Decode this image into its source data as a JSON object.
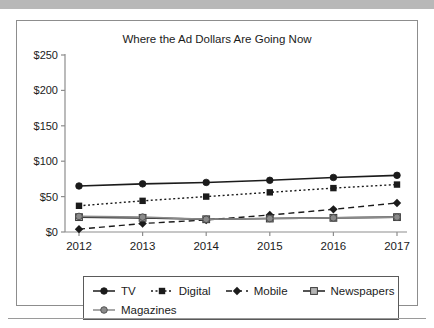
{
  "figure": {
    "title": "Where the Ad Dollars Are Going Now"
  },
  "legend": {
    "items": [
      {
        "label": "TV",
        "marker": "circle-filled",
        "dash": "solid",
        "color": "#1b1b1b"
      },
      {
        "label": "Digital",
        "marker": "square-filled",
        "dash": "dotted",
        "color": "#1b1b1b"
      },
      {
        "label": "Mobile",
        "marker": "diamond-filled",
        "dash": "dashed",
        "color": "#1b1b1b"
      },
      {
        "label": "Newspapers",
        "marker": "square-open",
        "dash": "solid",
        "color": "#1b1b1b"
      },
      {
        "label": "Magazines",
        "marker": "circle-filled-gray",
        "dash": "solid",
        "color": "#8a8a8a"
      }
    ]
  },
  "chart_data": {
    "type": "line",
    "title": "Where the Ad Dollars Are Going Now",
    "xlabel": "",
    "ylabel": "",
    "x": [
      "2012",
      "2013",
      "2014",
      "2015",
      "2016",
      "2017"
    ],
    "categories": [
      "2012",
      "2013",
      "2014",
      "2015",
      "2016",
      "2017"
    ],
    "ytick_labels": [
      "$0",
      "$50",
      "$100",
      "$150",
      "$200",
      "$250"
    ],
    "ytick_values": [
      0,
      50,
      100,
      150,
      200,
      250
    ],
    "ylim": [
      0,
      250
    ],
    "grid": false,
    "legend_position": "bottom",
    "series": [
      {
        "name": "TV",
        "values": [
          65,
          68,
          70,
          73,
          77,
          80
        ]
      },
      {
        "name": "Digital",
        "values": [
          37,
          44,
          50,
          56,
          62,
          67
        ]
      },
      {
        "name": "Mobile",
        "values": [
          4,
          12,
          17,
          24,
          32,
          41
        ]
      },
      {
        "name": "Newspapers",
        "values": [
          21,
          20,
          18,
          19,
          20,
          21
        ]
      },
      {
        "name": "Magazines",
        "values": [
          22,
          21,
          18,
          19,
          20,
          21
        ]
      }
    ]
  }
}
